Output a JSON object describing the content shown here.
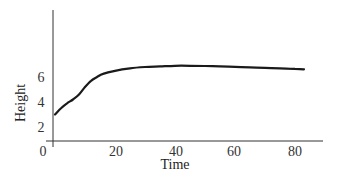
{
  "chart_data": {
    "type": "line",
    "title": "",
    "xlabel": "Time",
    "ylabel": "Height",
    "x_ticks": [
      "0",
      "20",
      "40",
      "60",
      "80"
    ],
    "y_ticks": [
      "0",
      "2",
      "4",
      "6"
    ],
    "xlim": [
      0,
      88
    ],
    "ylim": [
      0,
      11
    ],
    "grid": false,
    "legend": null,
    "series": [
      {
        "name": "Height",
        "x": [
          0,
          2,
          4,
          6,
          8,
          10,
          12,
          14,
          16,
          20,
          25,
          30,
          35,
          40,
          45,
          50,
          55,
          60,
          65,
          70,
          75,
          80,
          83
        ],
        "y": [
          3.0,
          3.5,
          3.9,
          4.2,
          4.6,
          5.2,
          5.7,
          6.0,
          6.25,
          6.5,
          6.7,
          6.8,
          6.85,
          6.9,
          6.9,
          6.88,
          6.85,
          6.82,
          6.78,
          6.74,
          6.7,
          6.65,
          6.62
        ]
      }
    ]
  }
}
